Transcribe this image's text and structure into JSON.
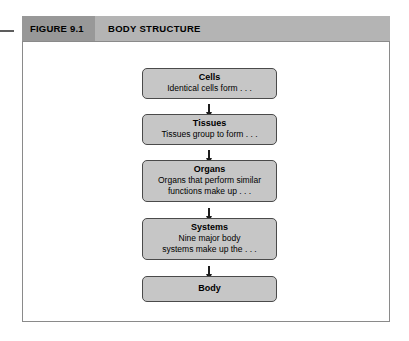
{
  "figure": {
    "label": "FIGURE 9.1",
    "title": "BODY STRUCTURE"
  },
  "colors": {
    "header_label_bg": "#989898",
    "header_title_bg": "#b4b4b4",
    "frame_border": "#8a8a8a",
    "node_fill": "#c6c6c6",
    "node_border": "#4a4a4a",
    "arrow": "#1d1d1d",
    "page_bg": "#ffffff"
  },
  "chart_data": {
    "type": "diagram",
    "subtype": "vertical-flowchart",
    "title": "BODY STRUCTURE",
    "orientation": "top-to-bottom",
    "nodes": [
      {
        "id": "cells",
        "title": "Cells",
        "description": "Identical cells form . . ."
      },
      {
        "id": "tissues",
        "title": "Tissues",
        "description": "Tissues group to form . . ."
      },
      {
        "id": "organs",
        "title": "Organs",
        "description": "Organs that perform similar\nfunctions make up . . ."
      },
      {
        "id": "systems",
        "title": "Systems",
        "description": "Nine major body\nsystems make up the . . ."
      },
      {
        "id": "body",
        "title": "Body",
        "description": ""
      }
    ],
    "edges": [
      {
        "from": "cells",
        "to": "tissues",
        "style": "arrow-down"
      },
      {
        "from": "tissues",
        "to": "organs",
        "style": "arrow-down"
      },
      {
        "from": "organs",
        "to": "systems",
        "style": "arrow-down"
      },
      {
        "from": "systems",
        "to": "body",
        "style": "arrow-down"
      }
    ]
  }
}
